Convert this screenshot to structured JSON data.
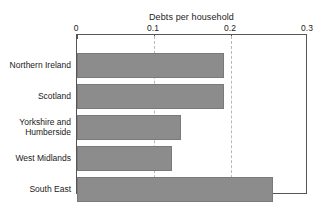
{
  "chart_data": {
    "type": "bar",
    "orientation": "horizontal",
    "title": "Debts per household",
    "xlabel": "",
    "ylabel": "",
    "xlim": [
      0,
      0.3
    ],
    "grid": true,
    "gridlines_at": [
      0.1,
      0.2
    ],
    "axis_position": "top",
    "legend": "none",
    "tick_labels": [
      "0",
      "0.1",
      "0.2",
      "0.3"
    ],
    "tick_values": [
      0,
      0.1,
      0.2,
      0.3
    ],
    "categories": [
      "Northern Ireland",
      "Scotland",
      "Yorkshire and Humberside",
      "West Midlands",
      "South East"
    ],
    "category_lines": [
      [
        "Northern Ireland"
      ],
      [
        "Scotland"
      ],
      [
        "Yorkshire and",
        "Humberside"
      ],
      [
        "West Midlands"
      ],
      [
        "South East"
      ]
    ],
    "values": [
      0.191,
      0.191,
      0.135,
      0.123,
      0.254
    ],
    "bar_color": "#8c8c8c",
    "bar_edge_color": "#7a7a7a",
    "frame_color": "#555555",
    "gridline_color": "#b8b8b8",
    "text_color": "#1a1a1a",
    "background": "#ffffff"
  }
}
